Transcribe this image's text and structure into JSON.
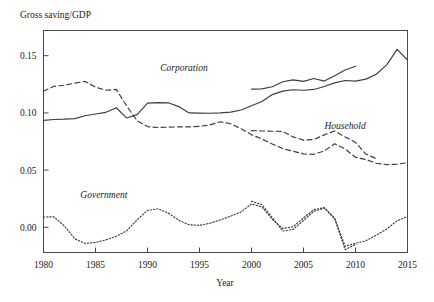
{
  "chart_data": {
    "type": "line",
    "title": "",
    "ylabel": "Gross saving/GDP",
    "xlabel": "Year",
    "xlim": [
      1980,
      2015
    ],
    "ylim": [
      -0.022,
      0.172
    ],
    "grid": false,
    "legend_position": "inline-annotations",
    "xticks": [
      "1980",
      "1985",
      "1990",
      "1995",
      "2000",
      "2005",
      "2010",
      "2015"
    ],
    "xtick_values": [
      1980,
      1985,
      1990,
      1995,
      2000,
      2005,
      2010,
      2015
    ],
    "yticks": [
      "0.00",
      "0.05",
      "0.10",
      "0.15"
    ],
    "ytick_values": [
      0.0,
      0.05,
      0.1,
      0.15
    ],
    "annotations": [
      {
        "text": "Corporation",
        "x": 1993.5,
        "y": 0.1365
      },
      {
        "text": "Household",
        "x": 2009.0,
        "y": 0.0855
      },
      {
        "text": "Government",
        "x": 1985.8,
        "y": 0.0255
      }
    ],
    "series": [
      {
        "name": "Corporation",
        "style": "solid",
        "x": [
          1980,
          1981,
          1982,
          1983,
          1984,
          1985,
          1986,
          1987,
          1988,
          1989,
          1990,
          1991,
          1992,
          1993,
          1994,
          1995,
          1996,
          1997,
          1998,
          1999,
          2000,
          2001,
          2002,
          2003,
          2004,
          2005,
          2006,
          2007,
          2008,
          2009,
          2010,
          2011,
          2012,
          2013,
          2014,
          2015
        ],
        "values": [
          0.0935,
          0.0942,
          0.0945,
          0.095,
          0.0975,
          0.099,
          0.1005,
          0.1045,
          0.0955,
          0.0985,
          0.1085,
          0.109,
          0.1088,
          0.1055,
          0.1,
          0.0998,
          0.0997,
          0.1,
          0.1007,
          0.1025,
          0.1062,
          0.11,
          0.116,
          0.119,
          0.1202,
          0.1198,
          0.1205,
          0.123,
          0.1262,
          0.1283,
          0.1278,
          0.1295,
          0.1338,
          0.142,
          0.1555,
          0.1462
        ]
      },
      {
        "name": "Corporation (alternative measure)",
        "style": "solid",
        "x": [
          2000,
          2001,
          2002,
          2003,
          2004,
          2005,
          2006,
          2007,
          2008,
          2009,
          2010
        ],
        "values": [
          0.1208,
          0.121,
          0.1228,
          0.1272,
          0.1288,
          0.1275,
          0.13,
          0.1278,
          0.1325,
          0.1375,
          0.1408
        ]
      },
      {
        "name": "Household",
        "style": "dashed",
        "x": [
          1980,
          1981,
          1982,
          1983,
          1984,
          1985,
          1986,
          1987,
          1988,
          1989,
          1990,
          1991,
          1992,
          1993,
          1994,
          1995,
          1996,
          1997,
          1998,
          1999,
          2000,
          2001,
          2002,
          2003,
          2004,
          2005,
          2006,
          2007,
          2008,
          2009,
          2010,
          2011,
          2012,
          2013,
          2014,
          2015
        ],
        "values": [
          0.119,
          0.1232,
          0.1242,
          0.126,
          0.1275,
          0.1225,
          0.1198,
          0.1205,
          0.106,
          0.0932,
          0.088,
          0.0872,
          0.0875,
          0.0878,
          0.0878,
          0.0882,
          0.0895,
          0.0922,
          0.0905,
          0.0862,
          0.081,
          0.0772,
          0.0728,
          0.0688,
          0.0665,
          0.0642,
          0.0638,
          0.0668,
          0.073,
          0.0685,
          0.0612,
          0.0592,
          0.056,
          0.0548,
          0.0552,
          0.0565
        ]
      },
      {
        "name": "Household (alternative measure)",
        "style": "dashed",
        "x": [
          2000,
          2001,
          2002,
          2003,
          2004,
          2005,
          2006,
          2007,
          2008,
          2009,
          2010,
          2011,
          2012
        ],
        "values": [
          0.0845,
          0.0842,
          0.084,
          0.0838,
          0.079,
          0.0762,
          0.0768,
          0.0808,
          0.0842,
          0.079,
          0.0742,
          0.064,
          0.06
        ]
      },
      {
        "name": "Government",
        "style": "dotted",
        "x": [
          1980,
          1981,
          1982,
          1983,
          1984,
          1985,
          1986,
          1987,
          1988,
          1989,
          1990,
          1991,
          1992,
          1993,
          1994,
          1995,
          1996,
          1997,
          1998,
          1999,
          2000,
          2001,
          2002,
          2003,
          2004,
          2005,
          2006,
          2007,
          2008,
          2009,
          2010,
          2011,
          2012,
          2013,
          2014,
          2015
        ],
        "values": [
          0.009,
          0.0092,
          0.0012,
          -0.01,
          -0.014,
          -0.0132,
          -0.011,
          -0.0078,
          -0.003,
          0.0065,
          0.0148,
          0.0162,
          0.0125,
          0.0062,
          0.0022,
          0.0018,
          0.0035,
          0.0065,
          0.0098,
          0.0135,
          0.0205,
          0.0178,
          0.007,
          -0.001,
          0.0005,
          0.0082,
          0.0155,
          0.0172,
          0.0078,
          -0.0165,
          -0.014,
          -0.0118,
          -0.0068,
          -0.0015,
          0.0058,
          0.0095
        ]
      },
      {
        "name": "Government (alternative measure)",
        "style": "dotted",
        "x": [
          2000,
          2001,
          2002,
          2003,
          2004,
          2005,
          2006,
          2007,
          2008,
          2009,
          2010
        ],
        "values": [
          0.0228,
          0.0198,
          0.0085,
          -0.0032,
          -0.0018,
          0.006,
          0.014,
          0.0168,
          0.0075,
          -0.0195,
          -0.015
        ]
      }
    ]
  }
}
